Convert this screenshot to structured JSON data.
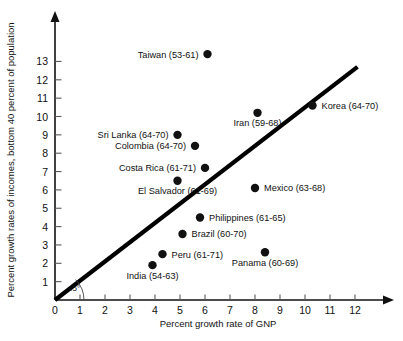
{
  "chart_data": {
    "type": "scatter",
    "title": "",
    "xlabel": "Percent growth rate of GNP",
    "ylabel": "Percent growth rates of incomes, bottom 40 percent of population",
    "xlim": [
      0,
      12.8
    ],
    "ylim": [
      0,
      13.8
    ],
    "xticks": [
      "0",
      "1",
      "2",
      "3",
      "4",
      "5",
      "6",
      "7",
      "8",
      "9",
      "10",
      "11",
      "12"
    ],
    "yticks": [
      "1",
      "2",
      "3",
      "4",
      "5",
      "6",
      "7",
      "8",
      "9",
      "10",
      "11",
      "12",
      "13"
    ],
    "grid": false,
    "legend": "none",
    "annotations": [
      {
        "name": "angle-annotation",
        "text": "45°"
      }
    ],
    "reference_line": {
      "name": "forty-five-degree-line",
      "description": "45 degree diagonal line",
      "x0": 0,
      "y0": 0,
      "x1": 12.1,
      "y1": 12.7
    },
    "points": [
      {
        "label": "Taiwan (53-61)",
        "x": 6.1,
        "y": 13.4,
        "label_side": "left"
      },
      {
        "label": "Korea (64-70)",
        "x": 10.3,
        "y": 10.6,
        "label_side": "right"
      },
      {
        "label": "Iran (59-68)",
        "x": 8.1,
        "y": 10.2,
        "label_side": "below"
      },
      {
        "label": "Sri Lanka (64-70)",
        "x": 4.9,
        "y": 9.0,
        "label_side": "left"
      },
      {
        "label": "Colombia (64-70)",
        "x": 5.6,
        "y": 8.4,
        "label_side": "left"
      },
      {
        "label": "Costa Rica (61-71)",
        "x": 6.0,
        "y": 7.2,
        "label_side": "left"
      },
      {
        "label": "El Salvador (61-69)",
        "x": 4.9,
        "y": 6.5,
        "label_side": "below"
      },
      {
        "label": "Mexico (63-68)",
        "x": 8.0,
        "y": 6.1,
        "label_side": "right"
      },
      {
        "label": "Philippines (61-65)",
        "x": 5.8,
        "y": 4.5,
        "label_side": "right"
      },
      {
        "label": "Brazil (60-70)",
        "x": 5.1,
        "y": 3.6,
        "label_side": "right"
      },
      {
        "label": "Panama (60-69)",
        "x": 8.4,
        "y": 2.6,
        "label_side": "below"
      },
      {
        "label": "Peru (61-71)",
        "x": 4.3,
        "y": 2.5,
        "label_side": "right"
      },
      {
        "label": "India (54-63)",
        "x": 3.9,
        "y": 1.9,
        "label_side": "below"
      }
    ]
  }
}
